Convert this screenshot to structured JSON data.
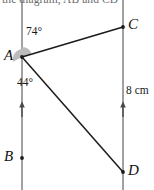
{
  "figure": {
    "header_text": "the diagram, AB and CD",
    "canvas": {
      "width": 154,
      "height": 190
    },
    "colors": {
      "parallel_line": "#8a8a8a",
      "segment": "#1b1b1b",
      "angle_fill": "#b9b9b9",
      "label_text": "#111111",
      "header_text": "#6b6b6b"
    },
    "points": [
      {
        "name": "A",
        "label": "A",
        "x": 22,
        "y": 57,
        "on": "left-line"
      },
      {
        "name": "B",
        "label": "B",
        "x": 22,
        "y": 158,
        "on": "left-line"
      },
      {
        "name": "C",
        "label": "C",
        "x": 123,
        "y": 27,
        "on": "right-line"
      },
      {
        "name": "D",
        "label": "D",
        "x": 123,
        "y": 172,
        "on": "right-line"
      }
    ],
    "parallel_lines": [
      {
        "name": "line-AB",
        "x": 22,
        "y1": 0,
        "y2": 190,
        "arrow_y": 110
      },
      {
        "name": "line-CD",
        "x": 123,
        "y1": 0,
        "y2": 190,
        "arrow_y": 110
      }
    ],
    "segments": [
      {
        "name": "segment-AC",
        "from": "A",
        "to": "C"
      },
      {
        "name": "segment-AD",
        "from": "A",
        "to": "D"
      }
    ],
    "angles": [
      {
        "name": "angle-CAB-upper",
        "label": "74°",
        "vertex": "A",
        "value": 74,
        "unit": "degrees"
      },
      {
        "name": "angle-DAB-lower",
        "label": "44°",
        "vertex": "A",
        "value": 44,
        "unit": "degrees"
      }
    ],
    "measurements": [
      {
        "name": "length-CD",
        "label": "8 cm",
        "value": 8,
        "unit": "cm",
        "of": "segment-CD"
      }
    ]
  }
}
